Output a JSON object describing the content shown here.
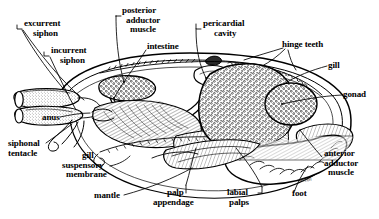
{
  "figure": {
    "signature": "Kleon",
    "ink_color": "#000000",
    "background_color": "#ffffff"
  },
  "labels": [
    {
      "id": "excurrent-siphon",
      "text_lines": [
        "excurrent",
        "siphon"
      ],
      "x": 24,
      "y": 20,
      "align": "left"
    },
    {
      "id": "incurrent-siphon",
      "text_lines": [
        "incurrent",
        "siphon"
      ],
      "x": 51,
      "y": 47,
      "align": "left"
    },
    {
      "id": "posterior-adductor-muscle",
      "text_lines": [
        "posterior",
        "adductor",
        "muscle"
      ],
      "x": 122,
      "y": 7,
      "align": "left"
    },
    {
      "id": "intestine",
      "text_lines": [
        "intestine"
      ],
      "x": 147,
      "y": 43,
      "align": "left"
    },
    {
      "id": "pericardial-cavity",
      "text_lines": [
        "pericardial",
        "cavity"
      ],
      "x": 203,
      "y": 20,
      "align": "left"
    },
    {
      "id": "hinge-teeth",
      "text_lines": [
        "hinge teeth"
      ],
      "x": 282,
      "y": 41,
      "align": "left"
    },
    {
      "id": "gill-right",
      "text_lines": [
        "gill"
      ],
      "x": 328,
      "y": 62,
      "align": "left"
    },
    {
      "id": "gonad",
      "text_lines": [
        "gonad"
      ],
      "x": 343,
      "y": 91,
      "align": "left"
    },
    {
      "id": "anus",
      "text_lines": [
        "anus"
      ],
      "x": 42,
      "y": 114,
      "align": "left"
    },
    {
      "id": "siphonal-tentacle",
      "text_lines": [
        "siphonal",
        "tentacle"
      ],
      "x": 10,
      "y": 140,
      "align": "left"
    },
    {
      "id": "gill-suspensory-membrane",
      "text_lines": [
        "gill",
        "suspensory",
        "membrane"
      ],
      "x": 62,
      "y": 152,
      "align": "left"
    },
    {
      "id": "mantle",
      "text_lines": [
        "mantle"
      ],
      "x": 94,
      "y": 192,
      "align": "left"
    },
    {
      "id": "palp-appendage",
      "text_lines": [
        "palp",
        "appendage"
      ],
      "x": 153,
      "y": 189,
      "align": "left"
    },
    {
      "id": "labial-palps",
      "text_lines": [
        "labial",
        "palps"
      ],
      "x": 224,
      "y": 189,
      "align": "left"
    },
    {
      "id": "foot",
      "text_lines": [
        "foot"
      ],
      "x": 292,
      "y": 190,
      "align": "left"
    },
    {
      "id": "anterior-adductor-muscle",
      "text_lines": [
        "anterior",
        "adductor",
        "muscle"
      ],
      "x": 324,
      "y": 150,
      "align": "left"
    }
  ],
  "structures": [
    {
      "id": "shell-valve",
      "name": "shell valve outline"
    },
    {
      "id": "mantle-edge",
      "name": "mantle edge"
    },
    {
      "id": "excurrent-siphon-tube",
      "name": "excurrent siphon tube"
    },
    {
      "id": "incurrent-siphon-tube",
      "name": "incurrent siphon tube"
    },
    {
      "id": "posterior-adductor",
      "name": "posterior adductor muscle"
    },
    {
      "id": "anterior-adductor",
      "name": "anterior adductor muscle"
    },
    {
      "id": "visceral-mass",
      "name": "visceral mass"
    },
    {
      "id": "gonad-mass",
      "name": "gonad"
    },
    {
      "id": "gill-lamella",
      "name": "gill lamella"
    },
    {
      "id": "foot-mass",
      "name": "foot"
    },
    {
      "id": "labial-palp",
      "name": "labial palps"
    },
    {
      "id": "hinge-teeth-row",
      "name": "hinge teeth row"
    },
    {
      "id": "intestine-loop",
      "name": "intestine"
    },
    {
      "id": "siphonal-tentacles",
      "name": "siphonal tentacles"
    }
  ]
}
